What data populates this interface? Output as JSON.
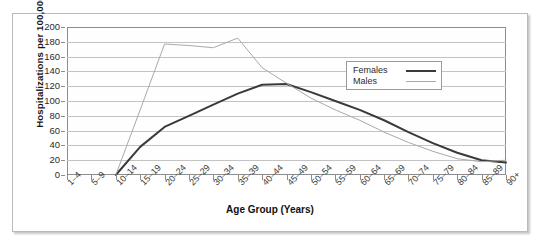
{
  "chart_data": {
    "type": "line",
    "title": "",
    "xlabel": "Age Group (Years)",
    "ylabel": "Hospitalizations per 100,000",
    "categories": [
      "1–4",
      "5–9",
      "10–14",
      "15–19",
      "20–24",
      "25–29",
      "30–34",
      "35–39",
      "40–44",
      "45–49",
      "50–54",
      "55–59",
      "60–64",
      "65–69",
      "70–74",
      "75–79",
      "80–84",
      "85–89",
      "90+"
    ],
    "ylim": [
      0,
      200
    ],
    "ytick_step": 20,
    "yticks": [
      "200",
      "180",
      "160",
      "140",
      "120",
      "100",
      "80",
      "60",
      "40",
      "20",
      "0"
    ],
    "grid": true,
    "legend_position": "upper-right-inside",
    "series": [
      {
        "name": "Females",
        "color": "#3a3a3a",
        "width": 2,
        "values": [
          null,
          null,
          0,
          38,
          65,
          80,
          95,
          110,
          122,
          123,
          112,
          100,
          88,
          74,
          58,
          43,
          30,
          20,
          17
        ]
      },
      {
        "name": "Males",
        "color": "#a9a9a9",
        "width": 1,
        "values": [
          null,
          null,
          0,
          88,
          177,
          175,
          172,
          185,
          145,
          124,
          104,
          88,
          74,
          58,
          44,
          32,
          22,
          18,
          20
        ]
      }
    ]
  },
  "legend": {
    "items": [
      {
        "label": "Females"
      },
      {
        "label": "Males"
      }
    ]
  }
}
